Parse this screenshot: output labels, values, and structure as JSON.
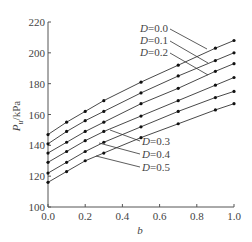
{
  "chart_data": {
    "type": "line",
    "title": "",
    "xlabel": "b",
    "ylabel": "P_u/kPa",
    "xlim": [
      0.0,
      1.0
    ],
    "ylim": [
      100,
      220
    ],
    "xticks": [
      "0.0",
      "0.2",
      "0.4",
      "0.6",
      "0.8",
      "1.0"
    ],
    "yticks": [
      "100",
      "120",
      "140",
      "160",
      "180",
      "200",
      "220"
    ],
    "grid": false,
    "legend_position": "inline-annotations",
    "x": [
      0.0,
      0.1,
      0.2,
      0.3,
      0.5,
      0.7,
      0.9,
      1.0
    ],
    "series": [
      {
        "name": "D=0.0",
        "values": [
          147,
          155,
          162,
          169,
          181,
          192,
          203,
          208
        ]
      },
      {
        "name": "D=0.1",
        "values": [
          141,
          149,
          156,
          162,
          174,
          185,
          195,
          200
        ]
      },
      {
        "name": "D=0.2",
        "values": [
          135,
          142,
          149,
          155,
          167,
          177,
          188,
          193
        ]
      },
      {
        "name": "D=0.3",
        "values": [
          129,
          136,
          143,
          149,
          159,
          169,
          179,
          184
        ]
      },
      {
        "name": "D=0.4",
        "values": [
          122,
          129,
          136,
          142,
          152,
          162,
          171,
          175
        ]
      },
      {
        "name": "D=0.5",
        "values": [
          116,
          123,
          130,
          135,
          145,
          154,
          163,
          167
        ]
      }
    ],
    "annotations": [
      "D=0.0",
      "D=0.1",
      "D=0.2",
      "D=0.3",
      "D=0.4",
      "D=0.5"
    ]
  },
  "axes": {
    "xlabel": "b",
    "ylabel_main": "P",
    "ylabel_sub": "u",
    "ylabel_unit": "/kPa"
  }
}
